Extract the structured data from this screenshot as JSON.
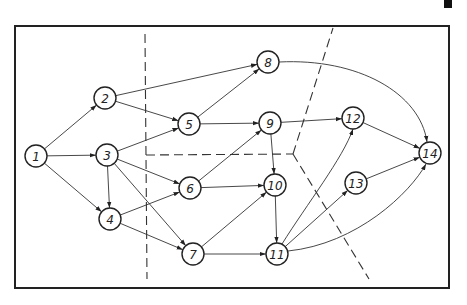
{
  "diagram": {
    "type": "directed-network-graph",
    "nodes": [
      {
        "id": "1",
        "label": "1",
        "x": 36,
        "y": 156
      },
      {
        "id": "2",
        "label": "2",
        "x": 105,
        "y": 98
      },
      {
        "id": "3",
        "label": "3",
        "x": 107,
        "y": 155
      },
      {
        "id": "4",
        "label": "4",
        "x": 110,
        "y": 219
      },
      {
        "id": "5",
        "label": "5",
        "x": 189,
        "y": 124
      },
      {
        "id": "6",
        "label": "6",
        "x": 190,
        "y": 188
      },
      {
        "id": "7",
        "label": "7",
        "x": 193,
        "y": 254
      },
      {
        "id": "8",
        "label": "8",
        "x": 268,
        "y": 62
      },
      {
        "id": "9",
        "label": "9",
        "x": 270,
        "y": 123
      },
      {
        "id": "10",
        "label": "10",
        "x": 275,
        "y": 185
      },
      {
        "id": "11",
        "label": "11",
        "x": 277,
        "y": 254
      },
      {
        "id": "12",
        "label": "12",
        "x": 353,
        "y": 118
      },
      {
        "id": "13",
        "label": "13",
        "x": 356,
        "y": 183
      },
      {
        "id": "14",
        "label": "14",
        "x": 430,
        "y": 153
      }
    ],
    "edges": [
      {
        "from": "1",
        "to": "2"
      },
      {
        "from": "1",
        "to": "3"
      },
      {
        "from": "1",
        "to": "4"
      },
      {
        "from": "2",
        "to": "8"
      },
      {
        "from": "2",
        "to": "5"
      },
      {
        "from": "3",
        "to": "5"
      },
      {
        "from": "3",
        "to": "4"
      },
      {
        "from": "3",
        "to": "6"
      },
      {
        "from": "3",
        "to": "7"
      },
      {
        "from": "4",
        "to": "6"
      },
      {
        "from": "4",
        "to": "7"
      },
      {
        "from": "5",
        "to": "8"
      },
      {
        "from": "5",
        "to": "9"
      },
      {
        "from": "6",
        "to": "9"
      },
      {
        "from": "6",
        "to": "10"
      },
      {
        "from": "7",
        "to": "10"
      },
      {
        "from": "7",
        "to": "11"
      },
      {
        "from": "9",
        "to": "12"
      },
      {
        "from": "9",
        "to": "10"
      },
      {
        "from": "10",
        "to": "11"
      },
      {
        "from": "11",
        "to": "12",
        "curve": true
      },
      {
        "from": "11",
        "to": "13"
      },
      {
        "from": "11",
        "to": "14",
        "curve": true
      },
      {
        "from": "12",
        "to": "14"
      },
      {
        "from": "13",
        "to": "14"
      },
      {
        "from": "8",
        "to": "14",
        "curve": true
      }
    ],
    "partition_lines": "dashed lines dividing graph into four regions",
    "colors": {
      "stroke": "#222222",
      "background": "#ffffff"
    }
  }
}
